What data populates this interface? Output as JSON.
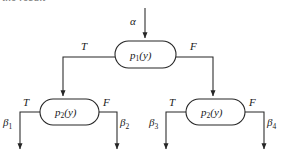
{
  "figure": {
    "clipped_header_text": "the result",
    "type": "binary-decision-tree",
    "background_color": "#ffffff",
    "stroke_color": "#262626"
  },
  "input": {
    "label": "α",
    "name": "alpha"
  },
  "nodes": [
    {
      "id": "root",
      "base": "p",
      "subscript": "1",
      "arg": "(y)",
      "full_label": "p1(y)"
    },
    {
      "id": "left-child",
      "base": "p",
      "subscript": "2",
      "arg": "(y)",
      "full_label": "p2(y)"
    },
    {
      "id": "right-child",
      "base": "p",
      "subscript": "2",
      "arg": "(y)",
      "full_label": "p2(y)"
    }
  ],
  "branches": {
    "root_true": "T",
    "root_false": "F",
    "left_true": "T",
    "left_false": "F",
    "right_true": "T",
    "right_false": "F"
  },
  "outputs": [
    {
      "id": "b1",
      "base": "β",
      "subscript": "1",
      "full_label": "β1"
    },
    {
      "id": "b2",
      "base": "β",
      "subscript": "2",
      "full_label": "β2"
    },
    {
      "id": "b3",
      "base": "β",
      "subscript": "3",
      "full_label": "β3"
    },
    {
      "id": "b4",
      "base": "β",
      "subscript": "4",
      "full_label": "β4"
    }
  ]
}
